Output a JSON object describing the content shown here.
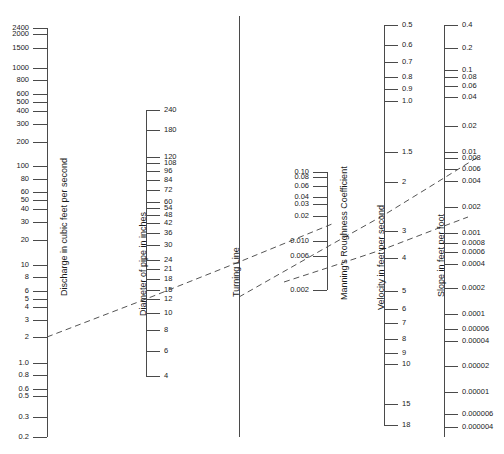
{
  "figure": {
    "kind": "nomograph",
    "note": "Manning's formula nomograph for circular pipe flow"
  },
  "chart_data": {
    "type": "line",
    "subtitle": "",
    "xlabel": "",
    "ylabel": "",
    "grid": false,
    "legend": "none",
    "scales": [
      {
        "id": "discharge",
        "title": "Discharge in cubic feet per second",
        "label_side": "left",
        "axis_x": 47,
        "title_x": 60,
        "title_y": 296,
        "y_top": 28,
        "y_bottom": 437,
        "ticks": [
          {
            "label": "2400",
            "y": 28
          },
          {
            "label": "2000",
            "y": 34
          },
          {
            "label": "1500",
            "y": 48
          },
          {
            "label": "1000",
            "y": 68
          },
          {
            "label": "800",
            "y": 80
          },
          {
            "label": "600",
            "y": 94
          },
          {
            "label": "500",
            "y": 102
          },
          {
            "label": "400",
            "y": 111
          },
          {
            "label": "300",
            "y": 124
          },
          {
            "label": "200",
            "y": 142
          },
          {
            "label": "100",
            "y": 166
          },
          {
            "label": "80",
            "y": 179
          },
          {
            "label": "60",
            "y": 192
          },
          {
            "label": "50",
            "y": 200
          },
          {
            "label": "40",
            "y": 209
          },
          {
            "label": "30",
            "y": 222
          },
          {
            "label": "20",
            "y": 240
          },
          {
            "label": "10",
            "y": 265
          },
          {
            "label": "8",
            "y": 277
          },
          {
            "label": "6",
            "y": 291
          },
          {
            "label": "5",
            "y": 299
          },
          {
            "label": "4",
            "y": 307
          },
          {
            "label": "3",
            "y": 320
          },
          {
            "label": "2",
            "y": 337
          },
          {
            "label": "1.0",
            "y": 363
          },
          {
            "label": "0.8",
            "y": 375
          },
          {
            "label": "0.6",
            "y": 389
          },
          {
            "label": "0.5",
            "y": 396
          },
          {
            "label": "0.3",
            "y": 417
          },
          {
            "label": "0.2",
            "y": 437
          }
        ]
      },
      {
        "id": "diameter",
        "title": "Diameter of pipe in inches",
        "label_side": "right",
        "axis_x": 146,
        "title_x": 139,
        "title_y": 316,
        "y_top": 110,
        "y_bottom": 376,
        "ticks": [
          {
            "label": "240",
            "y": 110
          },
          {
            "label": "180",
            "y": 130
          },
          {
            "label": "120",
            "y": 157
          },
          {
            "label": "108",
            "y": 163
          },
          {
            "label": "96",
            "y": 171
          },
          {
            "label": "84",
            "y": 180
          },
          {
            "label": "72",
            "y": 190
          },
          {
            "label": "60",
            "y": 202
          },
          {
            "label": "54",
            "y": 208
          },
          {
            "label": "48",
            "y": 215
          },
          {
            "label": "42",
            "y": 223
          },
          {
            "label": "36",
            "y": 233
          },
          {
            "label": "30",
            "y": 245
          },
          {
            "label": "24",
            "y": 260
          },
          {
            "label": "21",
            "y": 269
          },
          {
            "label": "18",
            "y": 279
          },
          {
            "label": "15",
            "y": 290
          },
          {
            "label": "12",
            "y": 299
          },
          {
            "label": "10",
            "y": 313
          },
          {
            "label": "8",
            "y": 330
          },
          {
            "label": "6",
            "y": 351
          },
          {
            "label": "4",
            "y": 376
          }
        ]
      },
      {
        "id": "turning-line",
        "title": "Turning Line",
        "label_side": "none",
        "axis_x": 239,
        "title_x": 232,
        "title_y": 297,
        "y_top": 16,
        "y_bottom": 437,
        "ticks": []
      },
      {
        "id": "roughness",
        "title": "Manning's Roughness Coefficient",
        "label_side": "left",
        "axis_x": 327,
        "title_x": 340,
        "title_y": 300,
        "y_top": 172,
        "y_bottom": 290,
        "ticks": [
          {
            "label": "0.10",
            "y": 172
          },
          {
            "label": "0.08",
            "y": 177
          },
          {
            "label": "0.06",
            "y": 186
          },
          {
            "label": "0.04",
            "y": 197
          },
          {
            "label": "0.03",
            "y": 204
          },
          {
            "label": "0.02",
            "y": 216
          },
          {
            "label": "0.010",
            "y": 241
          },
          {
            "label": "0.006",
            "y": 256
          },
          {
            "label": "0.002",
            "y": 290
          }
        ]
      },
      {
        "id": "velocity",
        "title": "Velocity in feet per second",
        "label_side": "right",
        "axis_x": 384,
        "title_x": 377,
        "title_y": 310,
        "y_top": 25,
        "y_bottom": 425,
        "ticks": [
          {
            "label": "0.5",
            "y": 25
          },
          {
            "label": "0.6",
            "y": 45
          },
          {
            "label": "0.7",
            "y": 62
          },
          {
            "label": "0.8",
            "y": 77
          },
          {
            "label": "0.9",
            "y": 89
          },
          {
            "label": "1.0",
            "y": 101
          },
          {
            "label": "1.5",
            "y": 152
          },
          {
            "label": "2",
            "y": 182
          },
          {
            "label": "3",
            "y": 231
          },
          {
            "label": "4",
            "y": 258
          },
          {
            "label": "5",
            "y": 291
          },
          {
            "label": "6",
            "y": 309
          },
          {
            "label": "7",
            "y": 323
          },
          {
            "label": "8",
            "y": 339
          },
          {
            "label": "9",
            "y": 353
          },
          {
            "label": "10",
            "y": 364
          },
          {
            "label": "15",
            "y": 404
          },
          {
            "label": "18",
            "y": 425
          }
        ]
      },
      {
        "id": "slope",
        "title": "Slope in feet per foot",
        "label_side": "right",
        "axis_x": 444,
        "title_x": 437,
        "title_y": 297,
        "y_top": 25,
        "y_bottom": 437,
        "ticks": [
          {
            "label": "0.4",
            "y": 25
          },
          {
            "label": "0.2",
            "y": 48
          },
          {
            "label": "0.1",
            "y": 70
          },
          {
            "label": "0.08",
            "y": 77
          },
          {
            "label": "0.06",
            "y": 86
          },
          {
            "label": "0.04",
            "y": 97
          },
          {
            "label": "0.02",
            "y": 126
          },
          {
            "label": "0.01",
            "y": 152
          },
          {
            "label": "0.008",
            "y": 158
          },
          {
            "label": "0.006",
            "y": 169
          },
          {
            "label": "0.004",
            "y": 181
          },
          {
            "label": "0.002",
            "y": 207
          },
          {
            "label": "0.001",
            "y": 233
          },
          {
            "label": "0.0008",
            "y": 243
          },
          {
            "label": "0.0006",
            "y": 252
          },
          {
            "label": "0.0004",
            "y": 264
          },
          {
            "label": "0.0002",
            "y": 288
          },
          {
            "label": "0.0001",
            "y": 314
          },
          {
            "label": "0.00006",
            "y": 329
          },
          {
            "label": "0.00004",
            "y": 341
          },
          {
            "label": "0.00002",
            "y": 366
          },
          {
            "label": "0.00001",
            "y": 392
          },
          {
            "label": "0.000006",
            "y": 414
          },
          {
            "label": "0.000004",
            "y": 427
          }
        ]
      }
    ],
    "isopleth": {
      "description": "Dashed solution line: discharge 2 cfs through 12 in pipe to turning line, then through roughness 0.010 to velocity/slope",
      "color": "#555555",
      "dash": "6 4",
      "segments": [
        {
          "name": "discharge-to-turning",
          "points": [
            [
              47,
              337
            ],
            [
              146,
              299
            ],
            [
              239,
              262
            ],
            [
              332,
              224
            ]
          ]
        },
        {
          "name": "turning-to-slope",
          "points": [
            [
              239,
              297
            ],
            [
              327,
              247
            ],
            [
              384,
              215
            ],
            [
              444,
              178
            ],
            [
              478,
              157
            ]
          ]
        },
        {
          "name": "roughness-to-slope-lower",
          "points": [
            [
              284,
              282
            ],
            [
              327,
              268
            ],
            [
              384,
              249
            ],
            [
              444,
              226
            ],
            [
              468,
              217
            ]
          ]
        }
      ]
    }
  }
}
